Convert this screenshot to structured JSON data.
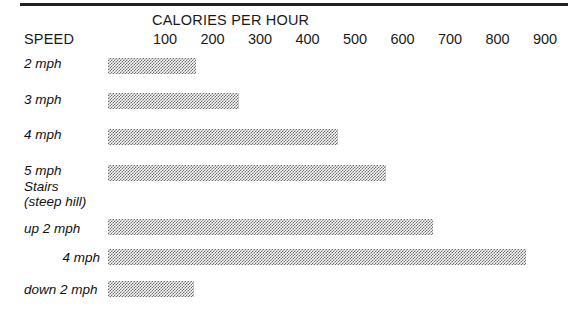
{
  "chart_data": {
    "type": "bar",
    "orientation": "horizontal",
    "title": "CALORIES PER HOUR",
    "xlabel": "CALORIES PER HOUR",
    "ylabel": "SPEED",
    "xlim": [
      0,
      950
    ],
    "grid": false,
    "legend": null,
    "xticks": [
      100,
      200,
      300,
      400,
      500,
      600,
      700,
      800,
      900
    ],
    "xtick_labels": [
      "100",
      "200",
      "300",
      "400",
      "500",
      "600",
      "700",
      "800",
      "900"
    ],
    "categories": [
      "2 mph",
      "3 mph",
      "4 mph",
      "5 mph",
      "up 2 mph",
      "4 mph",
      "down 2 mph"
    ],
    "values": [
      185,
      275,
      485,
      585,
      685,
      880,
      180
    ],
    "group_label": "Stairs\n(steep hill)",
    "bar_color": "#6d6d6d",
    "bar_fill": "50% checkerboard dither pattern"
  },
  "header": {
    "axis_title": "CALORIES PER HOUR",
    "speed_label": "SPEED"
  },
  "ticks": [
    {
      "label": "100",
      "value": 100
    },
    {
      "label": "200",
      "value": 200
    },
    {
      "label": "300",
      "value": 300
    },
    {
      "label": "400",
      "value": 400
    },
    {
      "label": "500",
      "value": 500
    },
    {
      "label": "600",
      "value": 600
    },
    {
      "label": "700",
      "value": 700
    },
    {
      "label": "800",
      "value": 800
    },
    {
      "label": "900",
      "value": 900
    }
  ],
  "rows": [
    {
      "label": "2 mph",
      "value": 185,
      "align": "left"
    },
    {
      "label": "3 mph",
      "value": 275,
      "align": "left"
    },
    {
      "label": "4 mph",
      "value": 485,
      "align": "left"
    },
    {
      "label": "5 mph",
      "value": 585,
      "align": "left"
    },
    {
      "label": "up 2 mph",
      "value": 685,
      "align": "left"
    },
    {
      "label": "4 mph",
      "value": 880,
      "align": "right"
    },
    {
      "label": "down 2 mph",
      "value": 180,
      "align": "left"
    }
  ],
  "group": {
    "line1": "Stairs",
    "line2": "(steep hill)"
  },
  "colors": {
    "rule": "#222222",
    "text": "#1a1a1a",
    "bar": "#6d6d6d",
    "background": "#ffffff"
  },
  "geometry": {
    "bar_origin_x": 108,
    "px_per_calorie": 0.475,
    "tick_100_x": 165,
    "bar_height": 16,
    "row_tops": [
      58,
      93,
      129,
      165,
      219,
      249,
      281
    ],
    "label_baselines": [
      67,
      103,
      138,
      174,
      232,
      261,
      293
    ],
    "group_top": 179
  }
}
